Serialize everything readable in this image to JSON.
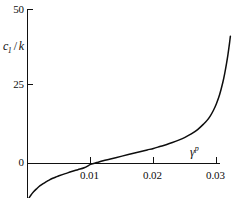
{
  "chart_data": {
    "type": "line",
    "title": "",
    "subtitle": "",
    "xlabel": "γ",
    "xlabel_superscript": "p",
    "ylabel": "c",
    "ylabel_subscript": "1",
    "ylabel_denominator": "k",
    "ylabel_slash": "/",
    "xlim": [
      0,
      0.034
    ],
    "ylim": [
      -15,
      50
    ],
    "xticks": [
      0.01,
      0.02,
      0.03
    ],
    "xtick_labels": [
      "0.01",
      "0.02",
      "0.03"
    ],
    "yticks": [
      0,
      25,
      50
    ],
    "ytick_labels": [
      "0",
      "25",
      "50"
    ],
    "grid": false,
    "legend": null,
    "asymptote_x": 0.0322,
    "zero_crossing_x": 0.0105,
    "series": [
      {
        "name": "c1/k",
        "x": [
          0.0,
          0.0005,
          0.001,
          0.0015,
          0.002,
          0.0025,
          0.003,
          0.0035,
          0.004,
          0.0045,
          0.005,
          0.006,
          0.007,
          0.008,
          0.009,
          0.01,
          0.0105,
          0.011,
          0.012,
          0.013,
          0.014,
          0.015,
          0.016,
          0.017,
          0.018,
          0.019,
          0.02,
          0.021,
          0.022,
          0.023,
          0.024,
          0.025,
          0.026,
          0.027,
          0.028,
          0.0285,
          0.029,
          0.0295,
          0.03,
          0.0305,
          0.031,
          0.0313,
          0.0316,
          0.0318,
          0.032,
          0.0321,
          0.0322
        ],
        "y": [
          -12.0,
          -10.4,
          -9.1,
          -8.1,
          -7.2,
          -6.5,
          -5.9,
          -5.3,
          -4.8,
          -4.4,
          -4.0,
          -3.3,
          -2.6,
          -2.0,
          -1.4,
          -0.3,
          0.0,
          0.3,
          0.9,
          1.4,
          1.9,
          2.4,
          2.9,
          3.4,
          3.9,
          4.4,
          4.9,
          5.5,
          6.1,
          6.8,
          7.6,
          8.5,
          9.6,
          11.0,
          12.9,
          14.0,
          15.4,
          17.2,
          19.5,
          22.4,
          26.3,
          29.2,
          32.6,
          35.1,
          38.0,
          39.6,
          41.3
        ]
      }
    ]
  },
  "figure": {
    "axis_color": "#111111",
    "curve_color": "#0d0d0d",
    "background": "#ffffff"
  }
}
